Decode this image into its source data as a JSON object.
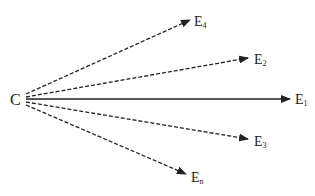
{
  "diagram": {
    "source": {
      "label": "C"
    },
    "targets": [
      {
        "id": "E4",
        "base": "E",
        "sub": "4",
        "style": "dashed"
      },
      {
        "id": "E2",
        "base": "E",
        "sub": "2",
        "style": "dashed"
      },
      {
        "id": "E1",
        "base": "E",
        "sub": "1",
        "style": "solid"
      },
      {
        "id": "E3",
        "base": "E",
        "sub": "3",
        "style": "dashed"
      },
      {
        "id": "En",
        "base": "E",
        "sub": "n",
        "style": "dashed"
      }
    ],
    "line_color": "#222222"
  }
}
